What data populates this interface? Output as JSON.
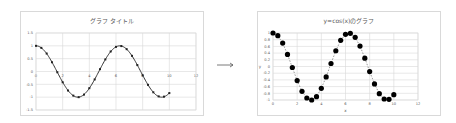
{
  "chart_data": [
    {
      "type": "line",
      "title": "グラフ タイトル",
      "xlabel": "",
      "ylabel": "",
      "xlim": [
        0,
        12
      ],
      "ylim": [
        -1.5,
        1.5
      ],
      "x_ticks": [
        0,
        2,
        4,
        6,
        8,
        10,
        12
      ],
      "y_ticks": [
        1.5,
        1,
        0.5,
        0,
        -0.5,
        -1,
        -1.5
      ],
      "grid": true,
      "legend": "none",
      "marker": "small-square",
      "line_style": "solid",
      "series": [
        {
          "name": "cos(x)",
          "x": [
            0,
            0.4,
            0.8,
            1.2,
            1.6,
            2.0,
            2.4,
            2.8,
            3.2,
            3.6,
            4.0,
            4.4,
            4.8,
            5.2,
            5.6,
            6.0,
            6.4,
            6.8,
            7.2,
            7.6,
            8.0,
            8.4,
            8.8,
            9.2,
            9.6,
            10.0
          ],
          "values": [
            1.0,
            0.92,
            0.7,
            0.36,
            -0.03,
            -0.42,
            -0.74,
            -0.94,
            -1.0,
            -0.9,
            -0.65,
            -0.31,
            0.09,
            0.47,
            0.78,
            0.96,
            0.99,
            0.87,
            0.61,
            0.25,
            -0.15,
            -0.52,
            -0.81,
            -0.97,
            -0.98,
            -0.84
          ]
        }
      ]
    },
    {
      "type": "scatter",
      "title": "y=cos(x)のグラフ",
      "xlabel": "x",
      "ylabel": "y",
      "xlim": [
        0,
        12
      ],
      "ylim": [
        -1,
        1
      ],
      "x_ticks": [
        0,
        2,
        4,
        6,
        8,
        10,
        12
      ],
      "y_ticks": [
        1,
        0.8,
        0.6,
        0.4,
        0.2,
        0,
        -0.2,
        -0.4,
        -0.6,
        -0.8,
        -1
      ],
      "grid": true,
      "legend": "none",
      "marker": "large-circle",
      "line_style": "dashed",
      "series": [
        {
          "name": "y=cos(x)",
          "x": [
            0,
            0.4,
            0.8,
            1.2,
            1.6,
            2.0,
            2.4,
            2.8,
            3.2,
            3.6,
            4.0,
            4.4,
            4.8,
            5.2,
            5.6,
            6.0,
            6.4,
            6.8,
            7.2,
            7.6,
            8.0,
            8.4,
            8.8,
            9.2,
            9.6,
            10.0
          ],
          "values": [
            1.0,
            0.92,
            0.7,
            0.36,
            -0.03,
            -0.42,
            -0.74,
            -0.94,
            -1.0,
            -0.9,
            -0.65,
            -0.31,
            0.09,
            0.47,
            0.78,
            0.96,
            0.99,
            0.87,
            0.61,
            0.25,
            -0.15,
            -0.52,
            -0.81,
            -0.97,
            -0.98,
            -0.84
          ]
        }
      ]
    }
  ],
  "arrow": {
    "glyph": "→"
  },
  "colors": {
    "series": "#000000",
    "grid": "#d9d9d9",
    "text": "#595959",
    "border": "#d9d9d9"
  }
}
